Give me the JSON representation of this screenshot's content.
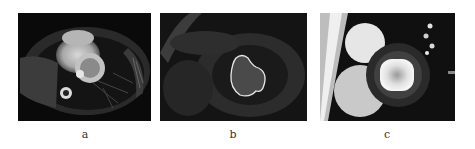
{
  "figure": {
    "panels": [
      {
        "id": "a",
        "label": "a",
        "description": "Axial cardiac MRI slice of the thorax showing the heart"
      },
      {
        "id": "b",
        "label": "b",
        "description": "Short-axis cardiac MRI with left-ventricle contour outlined"
      },
      {
        "id": "c",
        "label": "c",
        "description": "Short-axis cardiac MRI with bright left-ventricle blood pool"
      }
    ],
    "colors": {
      "background": "#ffffff",
      "panel_dark": "#0b0b0b",
      "contour": "#e8e8e8"
    }
  }
}
